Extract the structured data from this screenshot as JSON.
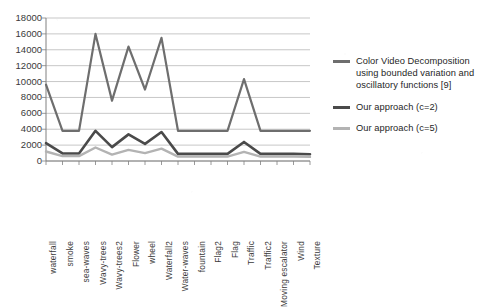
{
  "chart_data": {
    "type": "line",
    "title": "",
    "xlabel": "",
    "ylabel": "",
    "ylim": [
      0,
      18000
    ],
    "ytick_step": 2000,
    "yticks": [
      18000,
      16000,
      14000,
      12000,
      10000,
      8000,
      6000,
      4000,
      2000,
      0
    ],
    "grid": true,
    "legend_position": "right",
    "categories": [
      "waterfall",
      "smoke",
      "sea-waves",
      "Wavy-trees",
      "Wavy-trees2",
      "Flower",
      "wheel",
      "Waterfall2",
      "Water-waves",
      "fountain",
      "Flag2",
      "Flag",
      "Traffic",
      "Traffic2",
      "Moving escalator",
      "Wind",
      "Texture"
    ],
    "series": [
      {
        "name": "Color Video Decomposition using bounded variation and oscillatory functions  [9]",
        "color": "#6e6e6e",
        "width": 2.2,
        "values": [
          9600,
          3800,
          3800,
          16000,
          7600,
          14400,
          9000,
          15500,
          3800,
          3800,
          3800,
          3800,
          10300,
          3800,
          3800,
          3800,
          3800
        ]
      },
      {
        "name": "Our approach (c=2)",
        "color": "#4a4a4a",
        "width": 2.6,
        "values": [
          2250,
          950,
          950,
          3800,
          1750,
          3350,
          2150,
          3650,
          900,
          900,
          900,
          900,
          2400,
          900,
          900,
          900,
          850
        ]
      },
      {
        "name": "Our approach (c=5)",
        "color": "#b3b3b3",
        "width": 2.4,
        "values": [
          1200,
          620,
          620,
          1700,
          800,
          1400,
          1000,
          1550,
          560,
          560,
          560,
          560,
          1150,
          560,
          560,
          560,
          520
        ]
      }
    ]
  },
  "legend": {
    "entries": [
      {
        "label": "Color Video Decomposition using bounded variation and oscillatory functions  [9]",
        "color": "#6e6e6e"
      },
      {
        "label": "Our approach (c=2)",
        "color": "#4a4a4a"
      },
      {
        "label": "Our approach (c=5)",
        "color": "#b3b3b3"
      }
    ]
  },
  "axes": {
    "axis_color": "#808080",
    "grid_color": "#b9b9b9"
  }
}
